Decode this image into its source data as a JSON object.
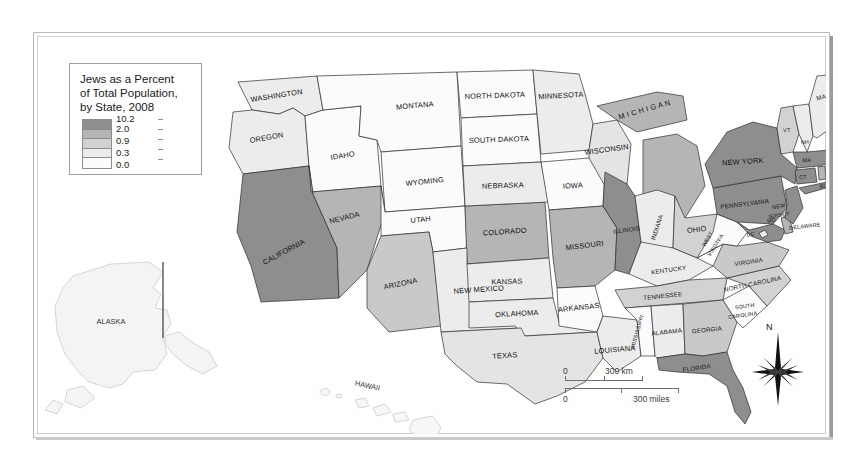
{
  "map": {
    "legend": {
      "title": "Jews as a Percent\nof Total Population,\nby State, 2008",
      "breaks": [
        "10.2",
        "2.0",
        "0.9",
        "0.3",
        "0.0"
      ],
      "colors": [
        "#8e8e8e",
        "#b5b5b5",
        "#d2d2d2",
        "#ececec",
        "#fbfbfb"
      ]
    },
    "scalebar": {
      "km_zero": "0",
      "km_max": "300 km",
      "mi_zero": "0",
      "mi_max": "300 miles"
    },
    "compass": {
      "north_label": "N"
    },
    "insets": [
      {
        "name": "alaska",
        "label": "ALASKA"
      },
      {
        "name": "hawaii",
        "label": "H A W A I İ"
      }
    ],
    "states": [
      {
        "code": "WA",
        "label": "WASHINGTON",
        "value": 0.6,
        "fill": "#ececec"
      },
      {
        "code": "OR",
        "label": "OREGON",
        "value": 0.8,
        "fill": "#ececec"
      },
      {
        "code": "ID",
        "label": "IDAHO",
        "value": 0.1,
        "fill": "#fbfbfb"
      },
      {
        "code": "MT",
        "label": "MONTANA",
        "value": 0.1,
        "fill": "#fbfbfb"
      },
      {
        "code": "WY",
        "label": "WYOMING",
        "value": 0.2,
        "fill": "#fbfbfb"
      },
      {
        "code": "CA",
        "label": "CALIFORNIA",
        "value": 3.3,
        "fill": "#8e8e8e"
      },
      {
        "code": "NV",
        "label": "NEVADA",
        "value": 2.7,
        "fill": "#b5b5b5"
      },
      {
        "code": "UT",
        "label": "UTAH",
        "value": 0.2,
        "fill": "#fbfbfb"
      },
      {
        "code": "AZ",
        "label": "ARIZONA",
        "value": 1.7,
        "fill": "#c9c9c9"
      },
      {
        "code": "CO",
        "label": "COLORADO",
        "value": 1.9,
        "fill": "#b5b5b5"
      },
      {
        "code": "NM",
        "label": "NEW MEXICO",
        "value": 0.6,
        "fill": "#ececec"
      },
      {
        "code": "ND",
        "label": "NORTH DAKOTA",
        "value": 0.1,
        "fill": "#fbfbfb"
      },
      {
        "code": "SD",
        "label": "SOUTH DAKOTA",
        "value": 0.1,
        "fill": "#fbfbfb"
      },
      {
        "code": "NE",
        "label": "NEBRASKA",
        "value": 0.4,
        "fill": "#ececec"
      },
      {
        "code": "KS",
        "label": "KANSAS",
        "value": 0.6,
        "fill": "#ececec"
      },
      {
        "code": "OK",
        "label": "OKLAHOMA",
        "value": 0.2,
        "fill": "#ececec"
      },
      {
        "code": "TX",
        "label": "TEXAS",
        "value": 0.5,
        "fill": "#e4e4e4"
      },
      {
        "code": "MN",
        "label": "MINNESOTA",
        "value": 0.8,
        "fill": "#ececec"
      },
      {
        "code": "IA",
        "label": "IOWA",
        "value": 0.2,
        "fill": "#fbfbfb"
      },
      {
        "code": "MO",
        "label": "MISSOURI",
        "value": 1.1,
        "fill": "#b5b5b5"
      },
      {
        "code": "AR",
        "label": "ARKANSAS",
        "value": 0.1,
        "fill": "#fbfbfb"
      },
      {
        "code": "LA",
        "label": "LOUISIANA",
        "value": 0.3,
        "fill": "#ececec"
      },
      {
        "code": "WI",
        "label": "WISCONSIN",
        "value": 0.5,
        "fill": "#e4e4e4"
      },
      {
        "code": "IL",
        "label": "ILLINOIS",
        "value": 2.3,
        "fill": "#8e8e8e"
      },
      {
        "code": "MI",
        "label": "M I C H I G A N",
        "value": 0.9,
        "fill": "#b5b5b5"
      },
      {
        "code": "IN",
        "label": "INDIANA",
        "value": 0.3,
        "fill": "#ececec"
      },
      {
        "code": "OH",
        "label": "OHIO",
        "value": 1.3,
        "fill": "#d2d2d2"
      },
      {
        "code": "KY",
        "label": "KENTUCKY",
        "value": 0.3,
        "fill": "#ececec"
      },
      {
        "code": "TN",
        "label": "TENNESSEE",
        "value": 0.3,
        "fill": "#d2d2d2"
      },
      {
        "code": "MS",
        "label": "MISSISSIPPI",
        "value": 0.1,
        "fill": "#fbfbfb"
      },
      {
        "code": "AL",
        "label": "ALABAMA",
        "value": 0.2,
        "fill": "#ececec"
      },
      {
        "code": "GA",
        "label": "GEORGIA",
        "value": 1.0,
        "fill": "#c9c9c9"
      },
      {
        "code": "FL",
        "label": "FLORIDA",
        "value": 3.4,
        "fill": "#8e8e8e"
      },
      {
        "code": "SC",
        "label": "SOUTH\nCAROLINA",
        "value": 0.2,
        "fill": "#fbfbfb"
      },
      {
        "code": "NC",
        "label": "NORTH CAROLINA",
        "value": 0.3,
        "fill": "#d2d2d2"
      },
      {
        "code": "VA",
        "label": "VIRGINIA",
        "value": 1.2,
        "fill": "#c9c9c9"
      },
      {
        "code": "WV",
        "label": "WEST\nVIRGINIA",
        "value": 0.1,
        "fill": "#fbfbfb"
      },
      {
        "code": "MD",
        "label": "MD",
        "value": 4.2,
        "fill": "#8e8e8e"
      },
      {
        "code": "DC",
        "label": "DC",
        "value": 4.5,
        "fill": "#ececec"
      },
      {
        "code": "DE",
        "label": "DELAWARE",
        "value": 1.7,
        "fill": "#b5b5b5"
      },
      {
        "code": "PA",
        "label": "PENNSYLVANIA",
        "value": 2.3,
        "fill": "#8e8e8e"
      },
      {
        "code": "NJ",
        "label": "NEW\nJERSEY",
        "value": 5.7,
        "fill": "#8e8e8e"
      },
      {
        "code": "NY",
        "label": "NEW YORK",
        "value": 8.4,
        "fill": "#8e8e8e"
      },
      {
        "code": "CT",
        "label": "CT",
        "value": 3.2,
        "fill": "#8e8e8e"
      },
      {
        "code": "RI",
        "label": "RI",
        "value": 1.3,
        "fill": "#b5b5b5"
      },
      {
        "code": "MA",
        "label": "MA",
        "value": 4.3,
        "fill": "#8e8e8e"
      },
      {
        "code": "VT",
        "label": "VT",
        "value": 0.9,
        "fill": "#d2d2d2"
      },
      {
        "code": "NH",
        "label": "NH",
        "value": 0.8,
        "fill": "#ececec"
      },
      {
        "code": "ME",
        "label": "MAINE",
        "value": 0.9,
        "fill": "#ececec"
      },
      {
        "code": "AK",
        "label": "ALASKA",
        "value": 0.5,
        "fill": "#f4f4f4"
      },
      {
        "code": "HI",
        "label": "HAWAII",
        "value": 0.5,
        "fill": "#f7f7f7"
      }
    ]
  }
}
